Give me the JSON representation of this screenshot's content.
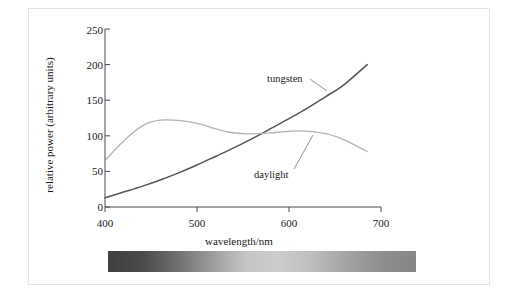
{
  "chart_data": {
    "type": "line",
    "title": "",
    "xlabel": "wavelength/nm",
    "ylabel": "relative power (arbitrary units)",
    "xlim": [
      400,
      700
    ],
    "ylim": [
      0,
      250
    ],
    "xticks": [
      400,
      500,
      600,
      700
    ],
    "yticks": [
      0,
      50,
      100,
      150,
      200,
      250
    ],
    "grid": false,
    "legend_position": "inline-annotation",
    "series": [
      {
        "name": "tungsten",
        "color": "#555555",
        "label_position": {
          "x": 553,
          "y": 196
        },
        "x": [
          400,
          420,
          440,
          460,
          480,
          500,
          520,
          540,
          560,
          580,
          600,
          620,
          640,
          660,
          685
        ],
        "y": [
          13,
          21,
          29,
          38,
          48,
          59,
          71,
          83,
          96,
          110,
          124,
          139,
          155,
          172,
          200
        ]
      },
      {
        "name": "daylight",
        "color": "#b3b3b3",
        "label_position": {
          "x": 545,
          "y": 62
        },
        "x": [
          400,
          415,
          430,
          445,
          460,
          475,
          490,
          505,
          520,
          535,
          550,
          565,
          580,
          595,
          610,
          625,
          640,
          655,
          670,
          685
        ],
        "y": [
          65,
          86,
          104,
          117,
          122,
          122,
          120,
          116,
          110,
          105,
          103,
          103,
          104,
          106,
          107,
          106,
          103,
          97,
          88,
          78
        ]
      }
    ],
    "annotations": [
      {
        "text": "tungsten",
        "leader_to": {
          "x": 612,
          "y": 148
        }
      },
      {
        "text": "daylight",
        "leader_to": {
          "x": 617,
          "y": 107
        }
      }
    ],
    "spectrum_bar": {
      "name": "visible-spectrum-bar",
      "range_nm": [
        400,
        700
      ],
      "rendering": "grayscale",
      "stops": [
        "#3f3f3f",
        "#4a4a4a",
        "#6e6e6e",
        "#9a9a9a",
        "#c4c4c4",
        "#cdcdcd",
        "#bdbdbd",
        "#a3a3a3",
        "#8e8e8e",
        "#868686"
      ]
    }
  }
}
